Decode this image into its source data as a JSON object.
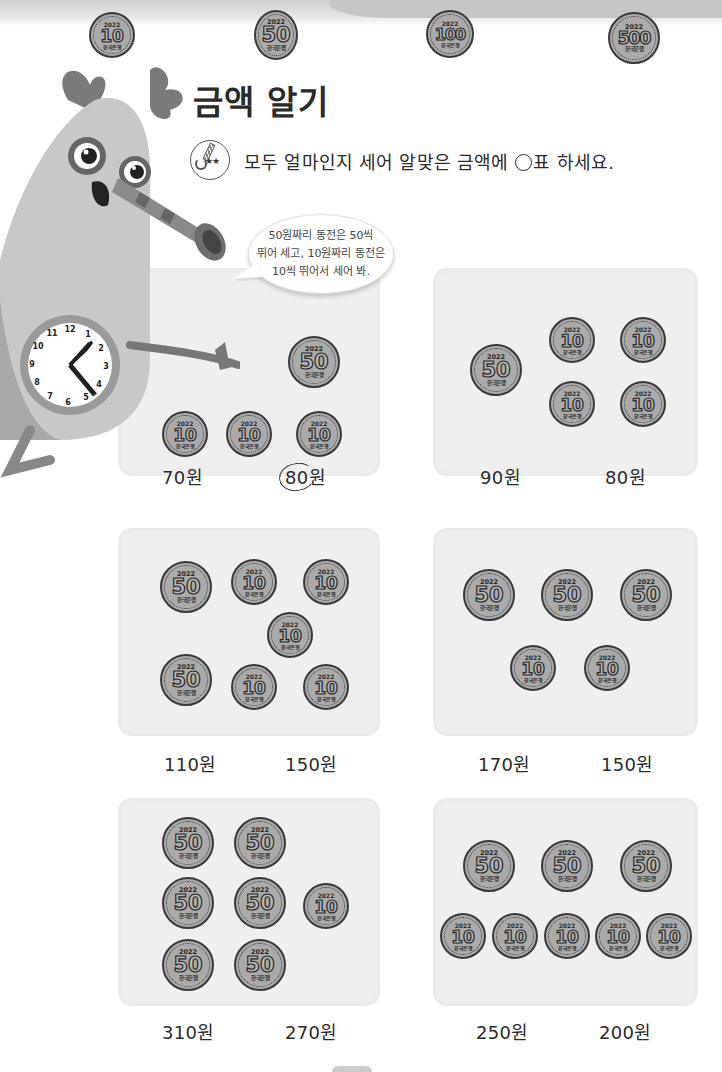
{
  "header": {
    "coins": [
      {
        "year": "2022",
        "value": "10",
        "bank": "한국은행"
      },
      {
        "year": "2022",
        "value": "50",
        "bank": "한국은행"
      },
      {
        "year": "2022",
        "value": "100",
        "bank": "한국은행"
      },
      {
        "year": "2022",
        "value": "500",
        "bank": "한국은행"
      }
    ]
  },
  "title": "금액 알기",
  "instruction": {
    "icon_stars": "★★",
    "text_before": "모두 얼마인지 세어 알맞은 금액에 ",
    "text_after": "표 하세요."
  },
  "speech_bubble": {
    "lines": [
      "50원짜리 동전은 50씩",
      "뛰어 세고, 10원짜리 동전은",
      "10씩 뛰어서 세어 봐."
    ]
  },
  "coin_labels": {
    "year": "2022",
    "bank": "한국은행",
    "ten": "10",
    "fifty": "50"
  },
  "problems": [
    {
      "coins": [
        "50",
        "10",
        "10",
        "10"
      ],
      "options": [
        "70원",
        "80원"
      ],
      "circled": "80원"
    },
    {
      "coins": [
        "50",
        "10",
        "10",
        "10",
        "10"
      ],
      "options": [
        "90원",
        "80원"
      ]
    },
    {
      "coins": [
        "50",
        "10",
        "10",
        "10",
        "50",
        "10",
        "10"
      ],
      "options": [
        "110원",
        "150원"
      ]
    },
    {
      "coins": [
        "50",
        "50",
        "50",
        "10",
        "10"
      ],
      "options": [
        "170원",
        "150원"
      ]
    },
    {
      "coins": [
        "50",
        "50",
        "50",
        "50",
        "10",
        "50",
        "50"
      ],
      "options": [
        "310원",
        "270원"
      ]
    },
    {
      "coins": [
        "50",
        "50",
        "50",
        "10",
        "10",
        "10",
        "10",
        "10"
      ],
      "options": [
        "250원",
        "200원"
      ]
    }
  ],
  "clock": {
    "numbers": [
      "12",
      "1",
      "2",
      "3",
      "4",
      "5",
      "6",
      "7",
      "8",
      "9",
      "10",
      "11"
    ]
  }
}
